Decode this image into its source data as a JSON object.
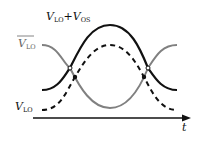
{
  "diagram": {
    "labels": {
      "sum_label_main": "V",
      "sum_label_sub1": "LO",
      "sum_label_plus": "+V",
      "sum_label_sub2": "OS",
      "vlo_bar_main": "V",
      "vlo_bar_sub": "LO",
      "vlo_main": "V",
      "vlo_sub": "LO",
      "time_axis": "t"
    },
    "colors": {
      "sum_curve": "#111111",
      "vlo_bar_curve": "#808080",
      "vlo_curve": "#111111",
      "axis": "#111111"
    },
    "curves": [
      {
        "name": "V_LO+V_OS",
        "style": "solid",
        "color": "black"
      },
      {
        "name": "V_LO_bar",
        "style": "solid",
        "color": "gray"
      },
      {
        "name": "V_LO",
        "style": "dashed",
        "color": "black"
      }
    ],
    "markers": {
      "open_crossings": 2,
      "filled_crossings": 2
    }
  }
}
